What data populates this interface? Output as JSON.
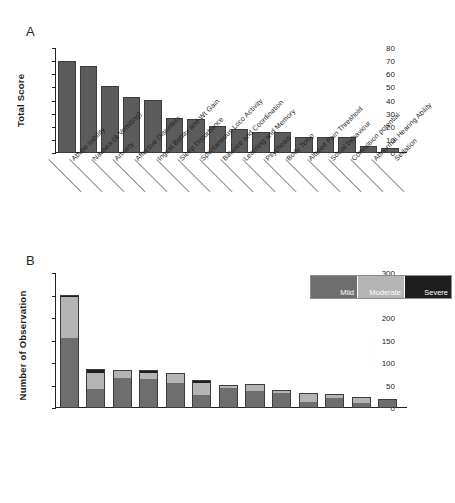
{
  "figure": {
    "panel_a_letter": "A",
    "panel_b_letter": "B"
  },
  "chart_data": [
    {
      "type": "bar",
      "panel": "A",
      "title": "",
      "xlabel": "",
      "ylabel": "Total Score",
      "ylim": [
        0,
        80
      ],
      "yticks": [
        0,
        10,
        20,
        30,
        40,
        50,
        60,
        70,
        80
      ],
      "grid": false,
      "legend": "none",
      "bar_color": "#5b5b5b",
      "categories": [
        "Abuse liability",
        "Nausea (& Vomiting)",
        "Anxiety",
        "Affective Disorders",
        "Ingest Behav and Wt Gain",
        "Sleep Disturbance",
        "Spontaneous Loco Activity",
        "Balance and Coordination",
        "Learning and Memory",
        "Psychosis",
        "Body Temp",
        "Altered Pain Threshold",
        "Social behaviour",
        "Convulsion potential",
        "Abnormal Hearing Ability",
        "Sedation"
      ],
      "values": [
        68.5,
        65,
        49.5,
        41.5,
        39,
        25,
        24.5,
        19,
        17,
        14.5,
        14.5,
        11,
        11,
        10.5,
        4,
        2.5
      ]
    },
    {
      "type": "bar",
      "subtype": "stacked",
      "panel": "B",
      "title": "",
      "xlabel": "",
      "ylabel": "Number of Observation",
      "ylim": [
        0,
        300
      ],
      "yticks": [
        0,
        50,
        100,
        150,
        200,
        250,
        300
      ],
      "grid": false,
      "legend_position": "top-right",
      "categories": [
        "Headache",
        "Nausea",
        "Fatigue",
        "Dizziness",
        "Other Cardiovascular",
        "Ortho Hypotension",
        "Hiccups",
        "Abdominal pain",
        "Diarrhoea",
        "Vomiting",
        "Loose stools",
        "Dyspepsia",
        "Somnolence"
      ],
      "series": [
        {
          "name": "Mild",
          "color": "#6e6e6e",
          "values": [
            157,
            43,
            68,
            65,
            57,
            29,
            47,
            38,
            35,
            12,
            22,
            10,
            19
          ]
        },
        {
          "name": "Moderate",
          "color": "#b4b4b4",
          "values": [
            92,
            37,
            16,
            16,
            20,
            28,
            5,
            15,
            5,
            22,
            10,
            14,
            1
          ]
        },
        {
          "name": "Severe",
          "color": "#1e1e1e",
          "values": [
            2,
            6,
            1,
            3,
            0,
            6,
            0,
            0,
            0,
            0,
            0,
            0,
            0
          ]
        }
      ],
      "totals": [
        251,
        86,
        85,
        84,
        77,
        63,
        52,
        53,
        40,
        34,
        32,
        24,
        20
      ]
    }
  ]
}
